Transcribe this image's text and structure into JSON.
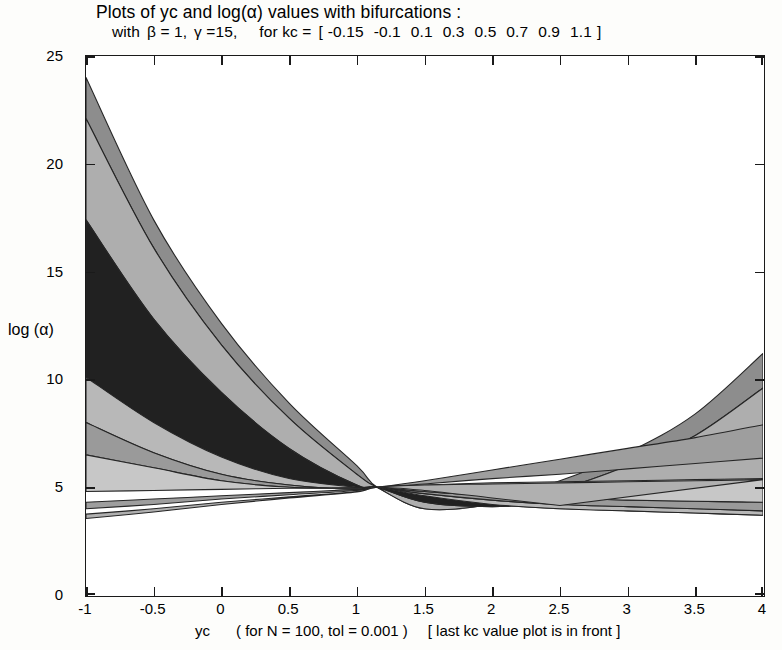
{
  "title": {
    "line1": "Plots of yc and log(α) values with bifurcations  :",
    "line2_prefix": "with",
    "line2_beta": "β = 1,",
    "line2_gamma": "γ =15,",
    "line2_for": "for  kc =",
    "line2_bracket_open": "[",
    "line2_bracket_close": "]"
  },
  "axes": {
    "ylabel": "log (α)",
    "xlabel_main": "yc",
    "xlabel_params": "( for N = 100,  tol = 0.001 )",
    "xlabel_note": "[ last kc value plot is in front ]",
    "xticks": [
      "-1",
      "-0.5",
      "0",
      "0.5",
      "1",
      "1.5",
      "2",
      "2.5",
      "3",
      "3.5",
      "4"
    ],
    "yticks": [
      "0",
      "5",
      "10",
      "15",
      "20",
      "25"
    ]
  },
  "chart_data": {
    "type": "area",
    "title": "Plots of yc and log(α) values with bifurcations  :",
    "subtitle": "with  β = 1, γ =15,     for  kc = [ -0.15 -0.1  0.1  0.3  0.5  0.7  0.9  1.1 ]",
    "xlabel": "yc   ( for N = 100,  tol = 0.001 )   [ last kc value plot is in front ]",
    "ylabel": "log (α)",
    "xlim": [
      -1,
      4
    ],
    "ylim": [
      0,
      25
    ],
    "grid": false,
    "legend": "none",
    "params": {
      "beta": 1,
      "gamma": 15,
      "N": 100,
      "tol": 0.001
    },
    "kc_values": [
      -0.15,
      -0.1,
      0.1,
      0.3,
      0.5,
      0.7,
      0.9,
      1.1
    ],
    "convergence_point": [
      1.15,
      5.0
    ],
    "x": [
      -1,
      -0.5,
      0,
      0.5,
      1,
      1.15,
      1.5,
      2,
      2.5,
      3,
      3.5,
      4
    ],
    "series": [
      {
        "name": "kc = -0.15",
        "fill": "#8d8d8d",
        "upper": [
          24.0,
          17.4,
          12.6,
          8.9,
          6.0,
          5.0,
          4.1,
          4.4,
          5.3,
          6.6,
          8.4,
          11.2
        ],
        "lower": [
          22.1,
          16.1,
          11.6,
          8.2,
          5.6,
          5.0,
          4.0,
          4.2,
          4.9,
          6.0,
          7.4,
          9.6
        ]
      },
      {
        "name": "kc = -0.1",
        "fill": "#aeaeae",
        "upper": [
          22.1,
          16.1,
          11.6,
          8.2,
          5.6,
          5.0,
          4.0,
          4.2,
          4.9,
          6.0,
          7.4,
          9.6
        ],
        "lower": [
          17.4,
          12.8,
          9.4,
          6.8,
          5.1,
          5.0,
          4.3,
          4.1,
          4.3,
          4.5,
          4.7,
          5.0
        ]
      },
      {
        "name": "kc = 0.1",
        "fill": "#212121",
        "upper": [
          17.4,
          12.8,
          9.4,
          6.8,
          5.1,
          5.0,
          4.3,
          4.1,
          4.3,
          4.5,
          4.7,
          5.0
        ],
        "lower": [
          10.1,
          8.0,
          6.4,
          5.4,
          5.0,
          5.0,
          4.6,
          4.2,
          4.0,
          3.9,
          3.8,
          3.7
        ]
      },
      {
        "name": "kc = 0.3",
        "fill": "#b8b8b8",
        "upper": [
          10.1,
          8.0,
          6.4,
          5.4,
          5.0,
          5.0,
          4.6,
          4.2,
          4.0,
          3.9,
          3.8,
          3.7
        ],
        "lower": [
          8.0,
          6.6,
          5.6,
          5.1,
          4.9,
          5.0,
          4.7,
          4.4,
          4.2,
          4.1,
          4.0,
          3.9
        ]
      },
      {
        "name": "kc = 0.5",
        "fill": "#9a9a9a",
        "upper": [
          8.0,
          6.6,
          5.6,
          5.1,
          4.9,
          5.0,
          4.7,
          4.4,
          4.2,
          4.1,
          4.0,
          3.9
        ],
        "lower": [
          6.5,
          5.9,
          5.3,
          5.0,
          4.95,
          5.0,
          4.8,
          4.6,
          4.5,
          4.4,
          4.35,
          4.3
        ]
      },
      {
        "name": "kc = 0.7",
        "fill": "#c7c7c7",
        "upper": [
          6.5,
          5.9,
          5.3,
          5.0,
          4.95,
          5.0,
          4.8,
          4.6,
          4.5,
          4.4,
          4.35,
          4.3
        ],
        "lower": [
          4.8,
          4.85,
          4.9,
          4.95,
          4.98,
          5.0,
          5.1,
          5.2,
          5.25,
          5.3,
          5.35,
          5.4
        ]
      },
      {
        "name": "kc = 0.9",
        "fill": "#9e9e9e",
        "upper": [
          4.3,
          4.45,
          4.6,
          4.75,
          4.9,
          5.0,
          5.3,
          5.8,
          6.3,
          6.8,
          7.3,
          7.9
        ],
        "lower": [
          4.0,
          4.2,
          4.45,
          4.65,
          4.85,
          5.0,
          5.15,
          5.4,
          5.6,
          5.85,
          6.1,
          6.35
        ]
      },
      {
        "name": "kc = 1.1",
        "fill": "#b0b0b0",
        "upper": [
          3.75,
          4.0,
          4.3,
          4.55,
          4.8,
          5.0,
          5.1,
          5.15,
          5.2,
          5.25,
          5.3,
          5.35
        ],
        "lower": [
          3.55,
          3.85,
          4.2,
          4.5,
          4.78,
          5.0,
          4.85,
          4.5,
          4.15,
          null,
          null,
          null
        ]
      }
    ]
  },
  "colors": {
    "axis": "#1a1a1a",
    "background": "#ffffff",
    "dark_band": "#212121",
    "mid_band": "#8d8d8d",
    "light_band": "#c7c7c7"
  }
}
